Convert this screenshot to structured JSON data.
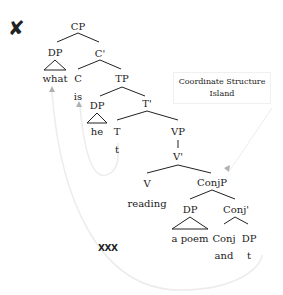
{
  "marks": {
    "ungrammatical": "✘",
    "crossed_out": "XXX"
  },
  "island_label": {
    "line1": "Coordinate Structure",
    "line2": "Island"
  },
  "nodes": {
    "cp": "CP",
    "dp1": "DP",
    "what": "what",
    "cbar": "C'",
    "c": "C",
    "is": "is",
    "tp": "TP",
    "dp2": "DP",
    "he": "he",
    "tbar": "T'",
    "t_head": "T",
    "t_trace": "t",
    "vp": "VP",
    "vbar": "V'",
    "v": "V",
    "reading": "reading",
    "conjp": "ConjP",
    "dp3": "DP",
    "apoem": "a poem",
    "conjbar": "Conj'",
    "conj": "Conj",
    "and": "and",
    "dp4": "DP",
    "t_dp": "t"
  },
  "colors": {
    "tree": "#222222",
    "arrow": "#e6e6e6",
    "arrowhead": "#b0b0b0"
  }
}
